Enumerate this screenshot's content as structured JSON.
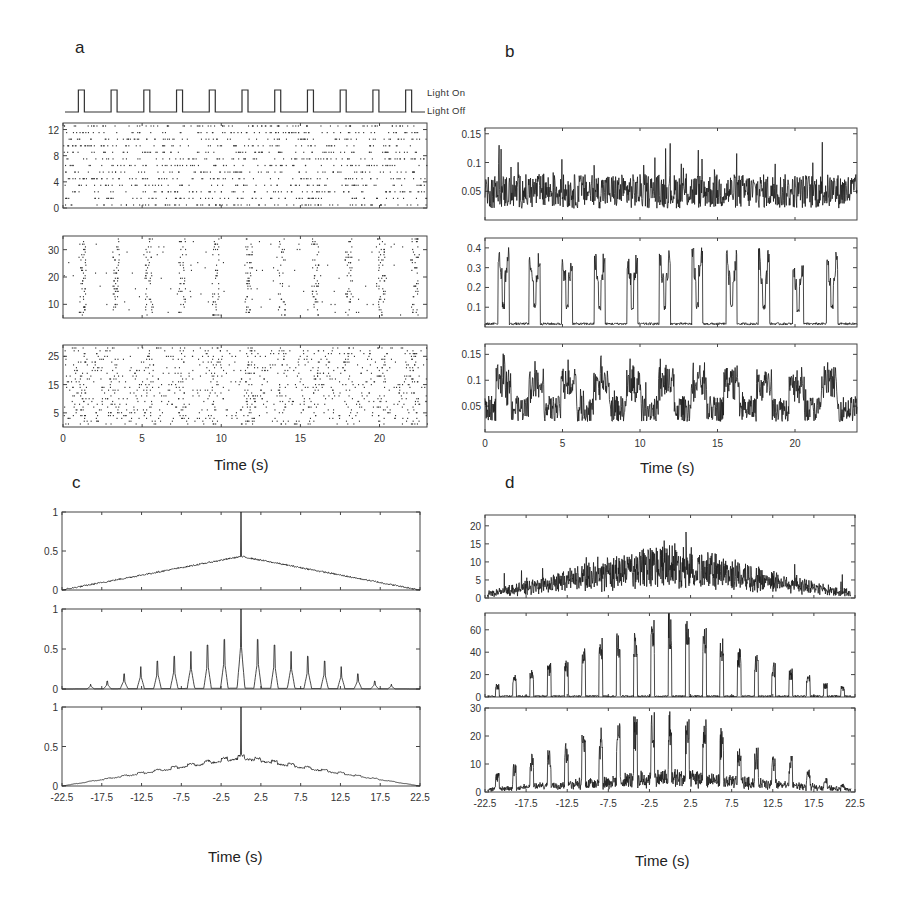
{
  "figure": {
    "panel_labels": {
      "a": "a",
      "b": "b",
      "c": "c",
      "d": "d"
    },
    "light_legend": {
      "on": "Light On",
      "off": "Light Off"
    },
    "xlabel": "Time (s)"
  },
  "chart_data": [
    {
      "id": "a-stimulus",
      "type": "line",
      "title": "Light stimulus",
      "legend": [
        "Light On",
        "Light Off"
      ],
      "pulses": 11,
      "pulse_period_s": 2.1,
      "pulse_width_s": 0.45,
      "xlim": [
        0,
        23
      ]
    },
    {
      "id": "a1",
      "type": "scatter",
      "title": "Raster - non-responsive population",
      "xlabel": "Time (s)",
      "ylabel": "Neuron #",
      "xlim": [
        0,
        23
      ],
      "ylim": [
        0,
        13
      ],
      "yticks": [
        0,
        4,
        8,
        12
      ],
      "xticks": [
        0,
        5,
        10,
        15,
        20
      ],
      "neurons": 13,
      "pattern": "uniform tonic firing, no light locking"
    },
    {
      "id": "a2",
      "type": "scatter",
      "title": "Raster - light-locked population",
      "xlim": [
        0,
        23
      ],
      "ylim": [
        5,
        35
      ],
      "yticks": [
        10,
        20,
        30
      ],
      "xticks": [
        0,
        5,
        10,
        15,
        20
      ],
      "neurons": 30,
      "pattern": "bursts locked to 11 light pulses"
    },
    {
      "id": "a3",
      "type": "scatter",
      "title": "Raster - partially locked population",
      "xlim": [
        0,
        23
      ],
      "ylim": [
        0,
        29
      ],
      "yticks": [
        5,
        15,
        25
      ],
      "xticks": [
        0,
        5,
        10,
        15,
        20
      ],
      "xticklabels": [
        "0",
        "5",
        "10",
        "15",
        "20"
      ],
      "neurons": 28,
      "pattern": "dense irregular firing with weak light modulation"
    },
    {
      "id": "b1",
      "type": "line",
      "title": "Population rate - group 1",
      "xlim": [
        0,
        24
      ],
      "ylim": [
        0,
        0.16
      ],
      "yticks": [
        0.05,
        0.1,
        0.15
      ],
      "yticklabels": [
        "0.05",
        "0.1",
        "0.15"
      ],
      "baseline": 0.05,
      "noise": 0.03,
      "peak_max": 0.15
    },
    {
      "id": "b2",
      "type": "line",
      "title": "Population rate - group 2",
      "xlim": [
        0,
        24
      ],
      "ylim": [
        0,
        0.45
      ],
      "yticks": [
        0.1,
        0.2,
        0.3,
        0.4
      ],
      "yticklabels": [
        "0.1",
        "0.2",
        "0.3",
        "0.4"
      ],
      "baseline": 0.01,
      "peak_times_s": [
        1.2,
        3.2,
        5.3,
        7.4,
        9.5,
        11.6,
        13.7,
        15.9,
        18.0,
        20.2,
        22.4
      ],
      "peak_values": [
        0.4,
        0.38,
        0.37,
        0.36,
        0.35,
        0.37,
        0.4,
        0.37,
        0.38,
        0.33,
        0.37
      ]
    },
    {
      "id": "b3",
      "type": "line",
      "title": "Population rate - group 3",
      "xlim": [
        0,
        24
      ],
      "ylim": [
        0,
        0.17
      ],
      "yticks": [
        0.05,
        0.1,
        0.15
      ],
      "yticklabels": [
        "0.05",
        "0.1",
        "0.15"
      ],
      "xticks": [
        0,
        5,
        10,
        15,
        20
      ],
      "xticklabels": [
        "0",
        "5",
        "10",
        "15",
        "20"
      ],
      "baseline": 0.045,
      "peak_values": [
        0.16,
        0.14,
        0.16,
        0.17,
        0.13,
        0.13,
        0.12,
        0.13,
        0.12,
        0.12,
        0.1
      ]
    },
    {
      "id": "c1",
      "type": "line",
      "title": "Autocorrelation - group 1",
      "xlim": [
        -22.5,
        22.5
      ],
      "ylim": [
        0,
        1
      ],
      "yticks": [
        0,
        0.5,
        1
      ],
      "yticklabels": [
        "0",
        "0.5",
        "1"
      ],
      "shape": "triangle",
      "peak_at_0": 0.43,
      "center_spike": 1.0
    },
    {
      "id": "c2",
      "type": "line",
      "title": "Autocorrelation - group 2",
      "xlim": [
        -22.5,
        22.5
      ],
      "ylim": [
        0,
        1
      ],
      "yticks": [
        0,
        0.5,
        1
      ],
      "yticklabels": [
        "0",
        "0.5",
        "1"
      ],
      "shape": "periodic peaks, period 2.1 s",
      "peak_lags_s": [
        -18.9,
        -16.8,
        -14.7,
        -12.6,
        -10.5,
        -8.4,
        -6.3,
        -4.2,
        -2.1,
        0,
        2.1,
        4.2,
        6.3,
        8.4,
        10.5,
        12.6,
        14.7,
        16.8,
        18.9
      ],
      "peak_values": [
        0.06,
        0.1,
        0.19,
        0.28,
        0.35,
        0.41,
        0.47,
        0.55,
        0.62,
        1.0,
        0.62,
        0.55,
        0.47,
        0.41,
        0.35,
        0.28,
        0.19,
        0.1,
        0.06
      ]
    },
    {
      "id": "c3",
      "type": "line",
      "title": "Autocorrelation - group 3",
      "xlim": [
        -22.5,
        22.5
      ],
      "ylim": [
        0,
        1
      ],
      "yticks": [
        0,
        0.5,
        1
      ],
      "yticklabels": [
        "0",
        "0.5",
        "1"
      ],
      "xticks": [
        -22.5,
        -17.5,
        -12.5,
        -7.5,
        -2.5,
        2.5,
        7.5,
        12.5,
        17.5,
        22.5
      ],
      "xticklabels": [
        "-22.5",
        "-17.5",
        "-12.5",
        "-7.5",
        "-2.5",
        "2.5",
        "7.5",
        "12.5",
        "17.5",
        "22.5"
      ],
      "xlabel": "Time (s)",
      "shape": "triangle with small periodic ripples",
      "peak_at_0": 0.35,
      "center_spike": 1.0
    },
    {
      "id": "d1",
      "type": "line",
      "title": "Cross-correlation - group 1",
      "xlim": [
        -22.5,
        22.5
      ],
      "ylim": [
        0,
        23
      ],
      "yticks": [
        0,
        5,
        10,
        15,
        20
      ],
      "yticklabels": [
        "0",
        "5",
        "10",
        "15",
        "20"
      ],
      "shape": "noisy triangle",
      "peak_mean": 12,
      "peak_max": 23
    },
    {
      "id": "d2",
      "type": "line",
      "title": "Cross-correlation - group 2",
      "xlim": [
        -22.5,
        22.5
      ],
      "ylim": [
        0,
        75
      ],
      "yticks": [
        0,
        20,
        40,
        60
      ],
      "yticklabels": [
        "0",
        "20",
        "40",
        "60"
      ],
      "peak_values": [
        12,
        20,
        27,
        31,
        33,
        47,
        56,
        57,
        63,
        70,
        75,
        70,
        63,
        53,
        47,
        40,
        31,
        26,
        20,
        13,
        10
      ]
    },
    {
      "id": "d3",
      "type": "line",
      "title": "Cross-correlation - group 3",
      "xlim": [
        -22.5,
        22.5
      ],
      "ylim": [
        0,
        30
      ],
      "yticks": [
        0,
        10,
        20,
        30
      ],
      "yticklabels": [
        "0",
        "10",
        "20",
        "30"
      ],
      "xticks": [
        -22.5,
        -17.5,
        -12.5,
        -7.5,
        -2.5,
        2.5,
        7.5,
        12.5,
        17.5,
        22.5
      ],
      "xticklabels": [
        "-22.5",
        "-17.5",
        "-12.5",
        "-7.5",
        "-2.5",
        "2.5",
        "7.5",
        "12.5",
        "17.5",
        "22.5"
      ],
      "xlabel": "Time (s)",
      "peak_values": [
        7,
        10,
        14,
        15,
        19,
        21,
        23,
        25,
        28,
        30,
        30,
        26,
        28,
        23,
        17,
        16,
        13,
        13,
        8,
        5,
        3
      ]
    }
  ]
}
